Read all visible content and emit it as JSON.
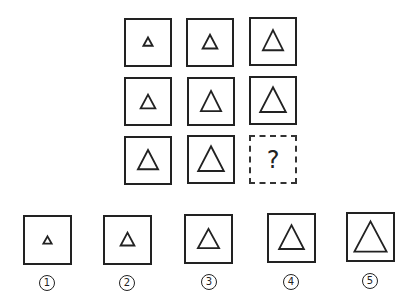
{
  "puzzle": {
    "grid": [
      [
        {
          "shape": "triangle",
          "size": 12
        },
        {
          "shape": "triangle",
          "size": 18
        },
        {
          "shape": "triangle",
          "size": 26
        }
      ],
      [
        {
          "shape": "triangle",
          "size": 18
        },
        {
          "shape": "triangle",
          "size": 26
        },
        {
          "shape": "triangle",
          "size": 32
        }
      ],
      [
        {
          "shape": "triangle",
          "size": 26
        },
        {
          "shape": "triangle",
          "size": 32
        },
        {
          "shape": "unknown"
        }
      ]
    ],
    "missing_label": "?"
  },
  "options": [
    {
      "label": "1",
      "size": 10
    },
    {
      "label": "2",
      "size": 18
    },
    {
      "label": "3",
      "size": 24
    },
    {
      "label": "4",
      "size": 30
    },
    {
      "label": "5",
      "size": 36
    }
  ],
  "colors": {
    "stroke": "#222222",
    "background": "#ffffff"
  }
}
